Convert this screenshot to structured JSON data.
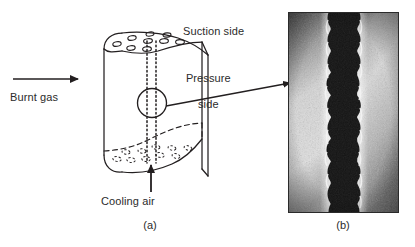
{
  "figure": {
    "panel_a": {
      "caption": "(a)",
      "labels": {
        "suction_side": "Suction side",
        "pressure_side_line1": "Pressure",
        "pressure_side_line2": "side",
        "burnt_gas": "Burnt gas",
        "cooling_air": "Cooling air"
      },
      "description": "Line schematic of a film-cooled turbine blade showing cooling holes on the suction side, a dotted internal cooling channel, and a magnifier circle linked by an arrow to panel (b).",
      "film_hole_count": 9,
      "hidden_hole_count": 10,
      "line_color": "#231f20",
      "arrow_color": "#231f20"
    },
    "panel_b": {
      "caption": "(b)",
      "description": "Grayscale micrograph cross-section of a laser-drilled cooling hole showing a vertical column of overlapping dark circular pulses.",
      "pulse_count": 9,
      "background_color": "#b9b9b9",
      "hole_color": "#1a1a1a",
      "highlight_color": "#f2f2f2"
    }
  }
}
